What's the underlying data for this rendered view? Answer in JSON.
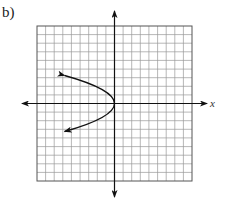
{
  "panel": {
    "label": "b)"
  },
  "chart_data": {
    "type": "line",
    "title": "",
    "xlabel": "x",
    "ylabel": "",
    "grid": true,
    "grid_cells": 18,
    "xlim": [
      -9,
      9
    ],
    "ylim": [
      -9,
      9
    ],
    "axes": {
      "x_arrows": true,
      "y_arrows": true
    },
    "series": [
      {
        "name": "sideways parabola opening left",
        "vertex": [
          0,
          0
        ],
        "equation_estimate": "x = -0.55 y^2",
        "endpoints_with_arrows": [
          [
            -5.8,
            3.25
          ],
          [
            -5.8,
            -3.25
          ]
        ],
        "points": [
          {
            "x": -5.8,
            "y": 3.25
          },
          {
            "x": -3.5,
            "y": 2.5
          },
          {
            "x": -1.4,
            "y": 1.6
          },
          {
            "x": 0,
            "y": 0
          },
          {
            "x": -1.4,
            "y": -1.6
          },
          {
            "x": -3.5,
            "y": -2.5
          },
          {
            "x": -5.8,
            "y": -3.25
          }
        ]
      }
    ]
  },
  "colors": {
    "grid": "#9a9a9a",
    "axes": "#111111",
    "curve": "#111111",
    "background": "#ffffff"
  }
}
